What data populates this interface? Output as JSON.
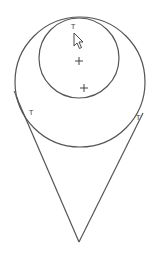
{
  "canvas": {
    "width": 161,
    "height": 258,
    "background": "#ffffff",
    "stroke": "#555555"
  },
  "outer_circle": {
    "cx": 80,
    "cy": 82,
    "r": 65
  },
  "inner_circle": {
    "cx": 79,
    "cy": 58,
    "r": 40
  },
  "center_marks": [
    {
      "x": 79,
      "y": 61
    },
    {
      "x": 84,
      "y": 88
    }
  ],
  "tangent_lines": [
    {
      "x1": 16,
      "y1": 96,
      "x2": 79,
      "y2": 242
    },
    {
      "x1": 143,
      "y1": 113,
      "x2": 79,
      "y2": 242
    }
  ],
  "tangent_markers": [
    {
      "label": "T",
      "x": 71,
      "y": 29
    },
    {
      "label": "T",
      "x": 29,
      "y": 115
    },
    {
      "label": "T",
      "x": 136,
      "y": 120
    }
  ],
  "cursor": {
    "icon": "arrow-pointer-icon",
    "x": 74,
    "y": 33
  }
}
